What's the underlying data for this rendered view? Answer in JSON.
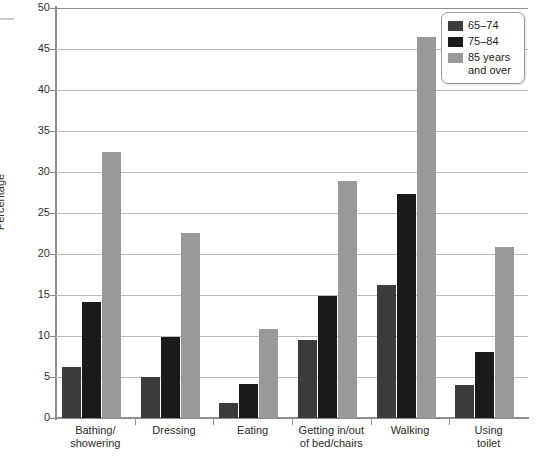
{
  "chart_data": {
    "type": "bar",
    "title": "",
    "subtitle": "",
    "xlabel": "",
    "ylabel": "Percentage",
    "ylim": [
      0,
      50
    ],
    "ytick_step": 5,
    "yticks": [
      0,
      5,
      10,
      15,
      20,
      25,
      30,
      35,
      40,
      45,
      50
    ],
    "grid": "horizontal",
    "legend_position": "top-right",
    "categories": [
      "Bathing/\nshowering",
      "Dressing",
      "Eating",
      "Getting in/out\nof bed/chairs",
      "Walking",
      "Using\ntoilet"
    ],
    "series": [
      {
        "name": "65–74",
        "color": "#3c3c3c",
        "values": [
          6.2,
          5.0,
          1.8,
          9.5,
          16.2,
          4.0
        ]
      },
      {
        "name": "75–84",
        "color": "#1a1a1a",
        "values": [
          14.2,
          9.9,
          4.1,
          14.9,
          27.3,
          8.0
        ]
      },
      {
        "name": "85 years\nand over",
        "color": "#999999",
        "values": [
          32.5,
          22.6,
          10.8,
          28.9,
          46.5,
          20.8
        ]
      }
    ]
  },
  "legend": {
    "items": [
      {
        "label": "65–74",
        "color": "#3c3c3c"
      },
      {
        "label": "75–84",
        "color": "#1a1a1a"
      },
      {
        "label": "85 years\nand over",
        "color": "#999999"
      }
    ]
  },
  "axis": {
    "y_title": "Percentage",
    "y_tick_labels": [
      "0",
      "5",
      "10",
      "15",
      "20",
      "25",
      "30",
      "35",
      "40",
      "45",
      "50"
    ]
  },
  "artifact": {
    "top_strip_text": ". . . . . ."
  }
}
